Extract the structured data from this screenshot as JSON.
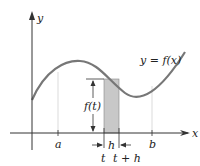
{
  "diagram": {
    "axes": {
      "x_label": "x",
      "y_label": "y"
    },
    "curve_label": "y = f(x)",
    "height_label": "f(t)",
    "width_label": "h",
    "ticks": {
      "a": "a",
      "t": "t",
      "t_plus_h": "t + h",
      "b": "b"
    },
    "colors": {
      "curve": "#777777",
      "shade": "#c8c8c8",
      "axis": "#333333"
    }
  }
}
